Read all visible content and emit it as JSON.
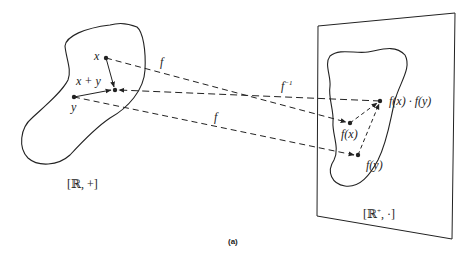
{
  "figure": {
    "caption": "(a)",
    "colors": {
      "stroke": "#222222",
      "background": "#ffffff"
    }
  },
  "left_set": {
    "label": "[ℝ, +]",
    "points": {
      "x": {
        "label": "x",
        "pos": [
          106,
          58
        ]
      },
      "y": {
        "label": "y",
        "pos": [
          74,
          97
        ]
      },
      "sum": {
        "label": "x + y",
        "pos": [
          115,
          90
        ]
      }
    }
  },
  "right_set": {
    "label_base": "[ℝ",
    "label_sup": "+",
    "label_tail": ", ·]",
    "points": {
      "fx": {
        "label": "f(x)",
        "pos": [
          350,
          123
        ]
      },
      "fy": {
        "label": "f(y)",
        "pos": [
          358,
          155
        ]
      },
      "product": {
        "label": "f(x) · f(y)",
        "pos": [
          380,
          101
        ]
      }
    }
  },
  "mappings": {
    "f_top": "f",
    "f_bottom": "f",
    "f_inverse_base": "f",
    "f_inverse_sup": "−1"
  }
}
